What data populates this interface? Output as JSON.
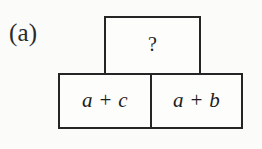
{
  "figure": {
    "panel_label": "(a)",
    "type": "arithmetic-pyramid-diagram",
    "colors": {
      "background": "#fbfbfa",
      "cell_fill": "#fdfdfc",
      "stroke": "#252525",
      "text": "#1c1c1c"
    },
    "top_cell": {
      "label": "?",
      "name": "unknown-sum-cell"
    },
    "bottom_cells": [
      {
        "label": "a + c",
        "name": "bottom-left-cell"
      },
      {
        "label": "a + b",
        "name": "bottom-right-cell"
      }
    ]
  }
}
